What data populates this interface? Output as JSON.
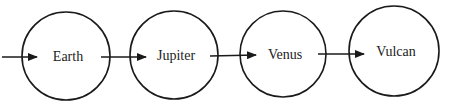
{
  "diagram": {
    "type": "linked-sequence",
    "nodes": [
      {
        "id": "earth",
        "label": "Earth",
        "cx": 66,
        "cy": 56,
        "r": 44
      },
      {
        "id": "jupiter",
        "label": "Jupiter",
        "cx": 174,
        "cy": 55,
        "r": 44
      },
      {
        "id": "venus",
        "label": "Venus",
        "cx": 283,
        "cy": 54,
        "r": 43
      },
      {
        "id": "vulcan",
        "label": "Vulcan",
        "cx": 394,
        "cy": 51,
        "r": 45
      }
    ],
    "edges": [
      {
        "from": "start",
        "to": "earth",
        "x1": 2,
        "y1": 57,
        "x2": 37,
        "y2": 57
      },
      {
        "from": "earth",
        "to": "jupiter",
        "x1": 101,
        "y1": 57,
        "x2": 146,
        "y2": 57
      },
      {
        "from": "jupiter",
        "to": "venus",
        "x1": 210,
        "y1": 56,
        "x2": 256,
        "y2": 55
      },
      {
        "from": "venus",
        "to": "vulcan",
        "x1": 318,
        "y1": 54,
        "x2": 364,
        "y2": 54
      }
    ],
    "colors": {
      "stroke": "#1a1a1a",
      "text": "#222222",
      "background": "#ffffff"
    }
  }
}
